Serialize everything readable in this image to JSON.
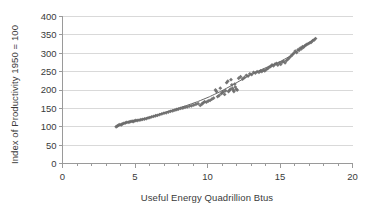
{
  "chart_data": {
    "type": "scatter",
    "title": "",
    "xlabel": "Useful Energy Quadrillion Btus",
    "ylabel": "Index of Productivity 1950 = 100",
    "xlim": [
      0,
      20
    ],
    "ylim": [
      0,
      400
    ],
    "xticks": [
      0,
      5,
      10,
      15,
      20
    ],
    "yticks": [
      0,
      50,
      100,
      150,
      200,
      250,
      300,
      350,
      400
    ],
    "grid": "horizontal",
    "legend": "none",
    "marker_color": "#6b6b6b",
    "line_color": "#555555",
    "gridline_color": "#d9d9d9",
    "axis_color": "#9a9a9a",
    "background": "#ffffff",
    "series": [
      {
        "name": "Productivity vs Useful Energy",
        "x": [
          3.7,
          3.78,
          3.86,
          3.95,
          4.05,
          4.12,
          4.22,
          4.32,
          4.4,
          4.52,
          4.6,
          4.7,
          4.8,
          4.88,
          4.95,
          5.05,
          5.15,
          5.28,
          5.4,
          5.52,
          5.65,
          5.78,
          5.9,
          6.02,
          6.15,
          6.28,
          6.42,
          6.55,
          6.7,
          6.85,
          7.0,
          7.15,
          7.3,
          7.45,
          7.6,
          7.75,
          7.88,
          8.0,
          8.15,
          8.3,
          8.45,
          8.6,
          8.75,
          8.9,
          9.05,
          9.2,
          9.35,
          9.5,
          9.62,
          9.7,
          9.8,
          9.92,
          10.05,
          10.18,
          10.3,
          10.42,
          10.55,
          10.62,
          10.7,
          10.8,
          10.88,
          10.95,
          11.02,
          11.1,
          11.18,
          11.25,
          11.32,
          11.4,
          11.45,
          11.52,
          11.58,
          11.62,
          11.68,
          11.72,
          11.78,
          11.82,
          11.88,
          11.92,
          11.98,
          12.05,
          12.15,
          12.28,
          12.42,
          12.55,
          12.68,
          12.8,
          12.92,
          13.05,
          13.18,
          13.3,
          13.42,
          13.55,
          13.65,
          13.75,
          13.85,
          13.95,
          14.05,
          14.15,
          14.25,
          14.35,
          14.45,
          14.55,
          14.65,
          14.75,
          14.85,
          14.95,
          15.05,
          15.15,
          15.25,
          15.35,
          15.45,
          15.55,
          15.65,
          15.75,
          15.85,
          15.95,
          16.05,
          16.15,
          16.25,
          16.32,
          16.4,
          16.48,
          16.55,
          16.62,
          16.7,
          16.78,
          16.85,
          16.95,
          17.05,
          17.15,
          17.25,
          17.35,
          17.45
        ],
        "y": [
          100,
          102,
          104,
          106,
          105,
          108,
          109,
          110,
          112,
          112,
          113,
          114,
          115,
          114,
          116,
          117,
          117,
          118,
          119,
          120,
          121,
          122,
          124,
          125,
          127,
          128,
          130,
          131,
          133,
          135,
          137,
          138,
          140,
          142,
          143,
          145,
          147,
          148,
          150,
          151,
          153,
          154,
          156,
          157,
          159,
          161,
          163,
          158,
          162,
          165,
          168,
          167,
          170,
          172,
          175,
          178,
          200,
          196,
          182,
          185,
          205,
          190,
          193,
          195,
          188,
          198,
          220,
          224,
          196,
          199,
          202,
          228,
          214,
          205,
          200,
          196,
          216,
          208,
          202,
          200,
          232,
          236,
          230,
          234,
          240,
          238,
          244,
          242,
          248,
          246,
          250,
          248,
          252,
          250,
          254,
          252,
          256,
          258,
          262,
          264,
          268,
          266,
          270,
          272,
          268,
          274,
          270,
          276,
          278,
          274,
          280,
          284,
          288,
          292,
          296,
          300,
          306,
          302,
          310,
          308,
          314,
          312,
          318,
          316,
          320,
          322,
          324,
          326,
          328,
          330,
          334,
          336,
          340
        ]
      }
    ],
    "trendline": {
      "name": "fitted curve",
      "x": [
        3.7,
        4.5,
        5.3,
        6.1,
        6.9,
        7.7,
        8.5,
        9.3,
        10.1,
        10.9,
        11.7,
        12.5,
        13.3,
        14.1,
        14.9,
        15.7,
        16.5,
        17.45
      ],
      "y": [
        101,
        112,
        119,
        127,
        137,
        147,
        157,
        168,
        181,
        196,
        213,
        231,
        248,
        262,
        275,
        292,
        315,
        341
      ]
    }
  }
}
